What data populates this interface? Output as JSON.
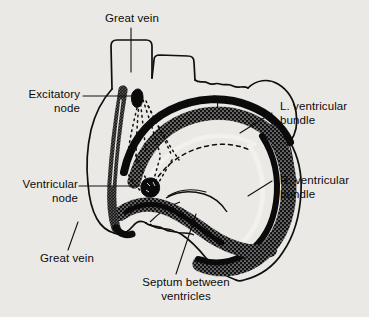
{
  "figure": {
    "background_color": "#ebe9e6",
    "ink_color": "#0c0c0c"
  },
  "labels": {
    "great_vein_top": "Great vein",
    "excitatory_node_line1": "Excitatory",
    "excitatory_node_line2": "node",
    "ventricular_node_line1": "Ventricular",
    "ventricular_node_line2": "node",
    "great_vein_bottom": "Great vein",
    "septum_line1": "Septum between",
    "septum_line2": "ventricles",
    "l_ventricular_bundle_line1": "L. ventricular",
    "l_ventricular_bundle_line2": "bundle",
    "r_ventricular_bundle_line1": "R. ventricular",
    "r_ventricular_bundle_line2": "bundle"
  },
  "parts": {
    "great_vein_superior": "great-vein-superior",
    "great_vein_inferior": "great-vein-inferior",
    "excitatory_node": "sinoatrial-excitatory-node",
    "ventricular_node": "atrioventricular-ventricular-node",
    "conduction_fibers": "dotted-conduction-fibers",
    "septum": "interventricular-septum",
    "left_bundle": "left-ventricular-bundle",
    "right_bundle": "right-ventricular-bundle",
    "heart_outline": "heart-outline"
  }
}
